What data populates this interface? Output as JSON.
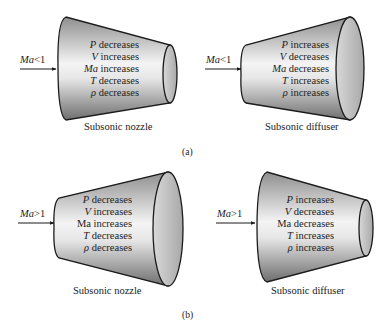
{
  "figure": {
    "panels": [
      {
        "id": "a",
        "label": "(a)",
        "diagrams": [
          {
            "kind": "nozzle",
            "shape": "converging",
            "inlet_condition": {
              "symbol": "Ma",
              "relation": "<",
              "value": "1"
            },
            "caption": "Subsonic nozzle",
            "properties": [
              {
                "symbol": "P",
                "symbol_italic": true,
                "trend": "decreases"
              },
              {
                "symbol": "V",
                "symbol_italic": true,
                "trend": "increases"
              },
              {
                "symbol": "Ma",
                "symbol_italic": true,
                "trend": "increases"
              },
              {
                "symbol": "T",
                "symbol_italic": true,
                "trend": "decreases"
              },
              {
                "symbol": "ρ",
                "symbol_italic": true,
                "trend": "decreases"
              }
            ]
          },
          {
            "kind": "diffuser",
            "shape": "diverging",
            "inlet_condition": {
              "symbol": "Ma",
              "relation": "<",
              "value": "1"
            },
            "caption": "Subsonic diffuser",
            "properties": [
              {
                "symbol": "P",
                "symbol_italic": true,
                "trend": "increases"
              },
              {
                "symbol": "V",
                "symbol_italic": true,
                "trend": "decreases"
              },
              {
                "symbol": "Ma",
                "symbol_italic": true,
                "trend": "decreases"
              },
              {
                "symbol": "T",
                "symbol_italic": true,
                "trend": "increases"
              },
              {
                "symbol": "ρ",
                "symbol_italic": true,
                "trend": "increases"
              }
            ]
          }
        ]
      },
      {
        "id": "b",
        "label": "(b)",
        "diagrams": [
          {
            "kind": "nozzle",
            "shape": "diverging",
            "inlet_condition": {
              "symbol": "Ma",
              "relation": ">",
              "value": "1"
            },
            "caption": "Subsonic nozzle",
            "properties": [
              {
                "symbol": "P",
                "symbol_italic": true,
                "trend": "decreases"
              },
              {
                "symbol": "V",
                "symbol_italic": true,
                "trend": "increases"
              },
              {
                "symbol": "Ma",
                "symbol_italic": false,
                "trend": "increases"
              },
              {
                "symbol": "T",
                "symbol_italic": true,
                "trend": "decreases"
              },
              {
                "symbol": "ρ",
                "symbol_italic": true,
                "trend": "decreases"
              }
            ]
          },
          {
            "kind": "diffuser",
            "shape": "converging",
            "inlet_condition": {
              "symbol": "Ma",
              "relation": ">",
              "value": "1"
            },
            "caption": "Subsonic diffuser",
            "properties": [
              {
                "symbol": "P",
                "symbol_italic": true,
                "trend": "increases"
              },
              {
                "symbol": "V",
                "symbol_italic": true,
                "trend": "decreases"
              },
              {
                "symbol": "Ma",
                "symbol_italic": false,
                "trend": "decreases"
              },
              {
                "symbol": "T",
                "symbol_italic": true,
                "trend": "increases"
              },
              {
                "symbol": "ρ",
                "symbol_italic": true,
                "trend": "increases"
              }
            ]
          }
        ]
      }
    ]
  }
}
